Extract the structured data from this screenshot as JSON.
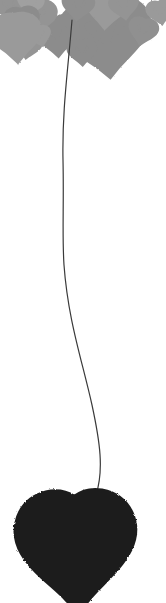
{
  "artwork": {
    "title": "Hearts Balloon Sketch",
    "canvas": {
      "width": 166,
      "height": 603,
      "background": "#ffffff"
    },
    "palette": {
      "heart_gray": "#8c8c8c",
      "heart_gray_light": "#a3a3a3",
      "heart_gray_dark": "#7a7a7a",
      "outline_gray": "#9a9a9a",
      "heart_dark": "#1f1f1f",
      "heart_dark_edge": "#2e2e2e",
      "string": "#3a3a3a",
      "background": "#ffffff",
      "texture_light": "#c9c9c9"
    },
    "cluster": {
      "label": "Top heart cluster",
      "count": 15,
      "hearts": [
        {
          "name": "heart-large-right",
          "style": "filled",
          "cx": 106,
          "cy": 36,
          "w": 66,
          "h": 56,
          "rot": -6,
          "color": "#8c8c8c"
        },
        {
          "name": "heart-medium-center",
          "style": "filled",
          "cx": 57,
          "cy": 35,
          "w": 33,
          "h": 30,
          "rot": -4,
          "color": "#8c8c8c"
        },
        {
          "name": "heart-medium-upper",
          "style": "filled",
          "cx": 36,
          "cy": 16,
          "w": 30,
          "h": 26,
          "rot": 8,
          "color": "#949494"
        },
        {
          "name": "heart-top-left-a",
          "style": "filled",
          "cx": 10,
          "cy": 6,
          "w": 24,
          "h": 21,
          "rot": -12,
          "color": "#949494"
        },
        {
          "name": "heart-top-left-b",
          "style": "filled",
          "cx": 30,
          "cy": 3,
          "w": 20,
          "h": 17,
          "rot": 14,
          "color": "#a0a0a0"
        },
        {
          "name": "heart-mid-left",
          "style": "filled",
          "cx": 22,
          "cy": 22,
          "w": 26,
          "h": 23,
          "rot": -6,
          "color": "#8c8c8c"
        },
        {
          "name": "heart-small-low-left",
          "style": "filled",
          "cx": 28,
          "cy": 46,
          "w": 20,
          "h": 18,
          "rot": 10,
          "color": "#949494"
        },
        {
          "name": "heart-small-lower",
          "style": "filled",
          "cx": 40,
          "cy": 36,
          "w": 17,
          "h": 15,
          "rot": -16,
          "color": "#9a9a9a"
        },
        {
          "name": "heart-outline-left",
          "style": "outline",
          "cx": 16,
          "cy": 35,
          "w": 24,
          "h": 21,
          "rot": -4,
          "color": "#9a9a9a"
        },
        {
          "name": "heart-outline-top",
          "style": "outline",
          "cx": 106,
          "cy": 8,
          "w": 18,
          "h": 16,
          "rot": 4,
          "color": "#9a9a9a"
        },
        {
          "name": "heart-top-right-a",
          "style": "filled",
          "cx": 124,
          "cy": 6,
          "w": 22,
          "h": 19,
          "rot": -8,
          "color": "#949494"
        },
        {
          "name": "heart-top-mid-a",
          "style": "filled",
          "cx": 78,
          "cy": 6,
          "w": 24,
          "h": 20,
          "rot": 6,
          "color": "#8f8f8f"
        },
        {
          "name": "heart-far-right",
          "style": "filled",
          "cx": 143,
          "cy": 31,
          "w": 22,
          "h": 20,
          "rot": 12,
          "color": "#909090"
        },
        {
          "name": "heart-right-edge",
          "style": "filled",
          "cx": 160,
          "cy": 12,
          "w": 20,
          "h": 18,
          "rot": -10,
          "color": "#9a9a9a"
        },
        {
          "name": "heart-bottom-center",
          "style": "filled",
          "cx": 82,
          "cy": 52,
          "w": 22,
          "h": 19,
          "rot": -3,
          "color": "#8c8c8c"
        }
      ]
    },
    "string": {
      "label": "Balloon string",
      "color": "#3a3a3a",
      "width": 1.2,
      "start": {
        "x": 72,
        "y": 20
      },
      "end": {
        "x": 88,
        "y": 520
      },
      "path": "M72,20 C68,70 62,110 63,160 C64,205 62,235 64,265 C68,320 82,360 92,405 C100,442 104,470 96,495 C92,508 89,514 88,521"
    },
    "bottom_heart": {
      "label": "Anchor heart",
      "style": "filled",
      "cx": 76,
      "cy": 548,
      "w": 88,
      "h": 86,
      "rot": -2,
      "color": "#1f1f1f"
    }
  }
}
